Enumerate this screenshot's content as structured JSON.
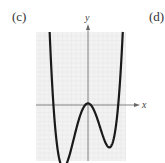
{
  "labels": {
    "left": "(c)",
    "right": "(d)"
  },
  "chart_data": {
    "type": "line",
    "title": "",
    "xlabel": "x",
    "ylabel": "y",
    "xlim": [
      -4.8,
      3.5
    ],
    "ylim": [
      -5.3,
      6.2
    ],
    "grid": true,
    "function": "0.25*(x^4 + 0.4x^3 - 8.96x^2) + 0.15",
    "coefficients": {
      "a4": 0.25,
      "a3": 0.1,
      "a2": -2.24,
      "a1": 0,
      "a0": 0.15
    },
    "domain": [
      -3.75,
      3.25
    ],
    "key_points": [
      {
        "label": "x-intercept",
        "x": -3.2,
        "y": 0
      },
      {
        "label": "local min",
        "x": -2.27,
        "y": -5.9
      },
      {
        "label": "local max",
        "x": 0,
        "y": 0.15
      },
      {
        "label": "local min",
        "x": 1.97,
        "y": -4.0
      },
      {
        "label": "x-intercept",
        "x": 2.8,
        "y": 0
      }
    ],
    "colors": {
      "curve": "#1a1a1a",
      "axis": "#666666",
      "grid": "#e6e6e6",
      "background": "#f2f2f2"
    }
  }
}
